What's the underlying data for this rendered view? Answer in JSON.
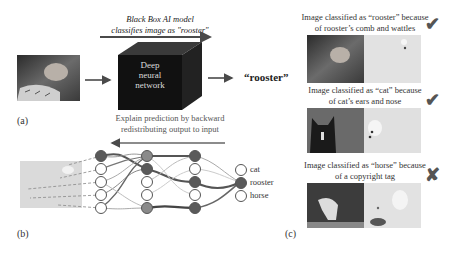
{
  "panel_a": {
    "label": "(a)",
    "caption_line1": "Black Box AI model",
    "caption_line2": "classifies image as \"rooster\"",
    "box_line1": "Deep",
    "box_line2": "neural",
    "box_line3": "network",
    "output": "“rooster”"
  },
  "panel_b": {
    "label": "(b)",
    "caption_line1": "Explain prediction by backward",
    "caption_line2": "redistributing output to input",
    "outputs": [
      "cat",
      "rooster",
      "horse"
    ]
  },
  "panel_c": {
    "label": "(c)",
    "items": [
      {
        "line1": "Image classified as “rooster” because",
        "line2": "of rooster’s comb and wattles",
        "mark": "✔",
        "mark_icon": "check-icon"
      },
      {
        "line1": "Image classified as “cat” because",
        "line2": "of cat’s ears and nose",
        "mark": "✔",
        "mark_icon": "check-icon"
      },
      {
        "line1": "Image classified as “horse” because",
        "line2": "of a copyright tag",
        "mark": "✘",
        "mark_icon": "cross-icon"
      }
    ]
  },
  "colors": {
    "arrow": "#4a4a4a",
    "cube_front": "#111111",
    "node_dark": "#5a5a5a",
    "node_mid": "#8a8a8a",
    "heatmap_bg": "#d9d9d9"
  }
}
